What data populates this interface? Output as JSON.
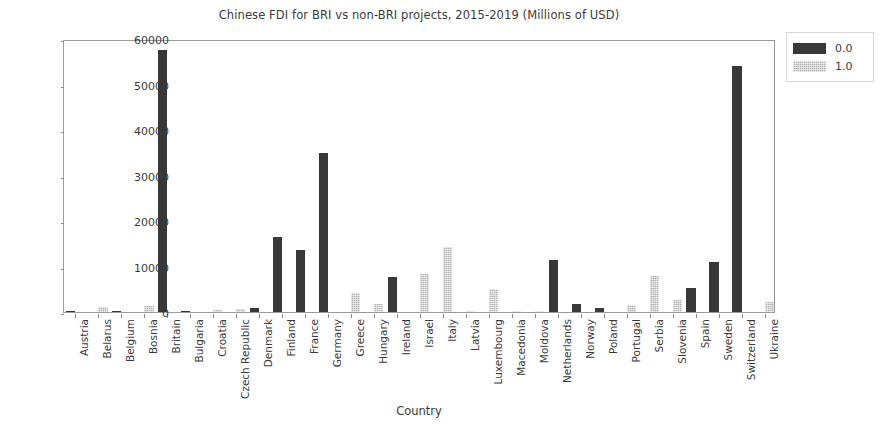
{
  "chart_data": {
    "type": "bar",
    "title": "Chinese FDI for BRI vs non-BRI projects, 2015-2019 (Millions of USD)",
    "xlabel": "Country",
    "ylabel": "",
    "ylim": [
      0,
      60000
    ],
    "yticks": [
      0,
      10000,
      20000,
      30000,
      40000,
      50000,
      60000
    ],
    "ytick_labels": [
      "0",
      "10000",
      "20000",
      "30000",
      "40000",
      "50000",
      "60000"
    ],
    "grid": false,
    "legend_position": "upper right",
    "legend_entries": [
      "0.0",
      "1.0"
    ],
    "series_colors": [
      "#383838",
      "#b4b4b4"
    ],
    "categories": [
      "Austria",
      "Belarus",
      "Belgium",
      "Bosnia",
      "Britain",
      "Bulgaria",
      "Croatia",
      "Czech Republic",
      "Denmark",
      "Finland",
      "France",
      "Germany",
      "Greece",
      "Hungary",
      "Ireland",
      "Israel",
      "Italy",
      "Latvia",
      "Luxembourg",
      "Macedonia",
      "Moldova",
      "Netherlands",
      "Norway",
      "Poland",
      "Portugal",
      "Serbia",
      "Slovenia",
      "Spain",
      "Sweden",
      "Switzerland",
      "Ukraine"
    ],
    "series": [
      {
        "name": "0.0",
        "values": [
          200,
          0,
          250,
          0,
          57500,
          150,
          0,
          0,
          900,
          16500,
          13700,
          35000,
          0,
          0,
          7800,
          0,
          0,
          0,
          0,
          0,
          0,
          11500,
          1800,
          900,
          0,
          0,
          0,
          5300,
          11000,
          54000,
          0
        ]
      },
      {
        "name": "1.0",
        "values": [
          0,
          1050,
          0,
          1300,
          0,
          0,
          500,
          600,
          0,
          0,
          0,
          0,
          4100,
          1700,
          0,
          8400,
          14300,
          150,
          5000,
          120,
          120,
          0,
          0,
          0,
          1500,
          8000,
          2700,
          0,
          0,
          0,
          2200
        ]
      }
    ]
  }
}
